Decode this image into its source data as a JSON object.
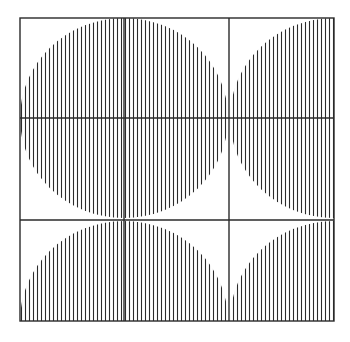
{
  "figure": {
    "colors": {
      "ink": "#2a2a2a",
      "background": "#ffffff"
    },
    "frame": {
      "x0": 20,
      "y0": 18,
      "x1": 334,
      "y1": 321
    },
    "grid_lines": {
      "vertical": [
        20,
        124,
        229,
        334
      ],
      "horizontal": [
        18,
        118,
        220,
        321
      ]
    },
    "hatch_spacing": 4,
    "shapes": [
      {
        "cell": "r0c0",
        "center": [
          124,
          118
        ],
        "quadrant": "upper-left"
      },
      {
        "cell": "r0c1",
        "center": [
          124,
          118
        ],
        "quadrant": "upper-right"
      },
      {
        "cell": "r0c2",
        "center": [
          334,
          118
        ],
        "quadrant": "upper-left"
      },
      {
        "cell": "r1c0",
        "center": [
          124,
          118
        ],
        "quadrant": "lower-left"
      },
      {
        "cell": "r1c1",
        "center": [
          124,
          118
        ],
        "quadrant": "lower-right"
      },
      {
        "cell": "r1c2",
        "center": [
          334,
          118
        ],
        "quadrant": "lower-left"
      },
      {
        "cell": "r2c0",
        "center": [
          124,
          321
        ],
        "quadrant": "upper-left"
      },
      {
        "cell": "r2c1",
        "center": [
          124,
          321
        ],
        "quadrant": "upper-right"
      },
      {
        "cell": "r2c2",
        "center": [
          334,
          321
        ],
        "quadrant": "upper-left"
      }
    ]
  }
}
